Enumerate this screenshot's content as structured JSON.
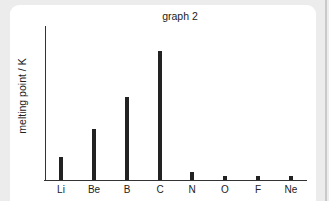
{
  "chart_data": {
    "type": "bar",
    "title": "graph 2",
    "xlabel": "",
    "ylabel": "melting point / K",
    "categories": [
      "Li",
      "Be",
      "B",
      "C",
      "N",
      "O",
      "F",
      "Ne"
    ],
    "values": [
      680,
      1500,
      2450,
      3800,
      240,
      120,
      120,
      120
    ],
    "ylim": [
      0,
      4500
    ],
    "y_ticks_shown": false,
    "grid": false,
    "legend": null
  },
  "layout": {
    "axis_left_px": 45,
    "axis_bottom_px": 180,
    "bar_x_px": [
      61,
      94,
      127,
      160,
      192,
      225,
      258,
      291
    ],
    "bar_top_px": [
      157,
      129,
      97,
      51,
      172,
      176,
      176,
      176
    ],
    "colors": {
      "background": "#ececec",
      "panel": "#ffffff",
      "bars": "#222222"
    }
  }
}
